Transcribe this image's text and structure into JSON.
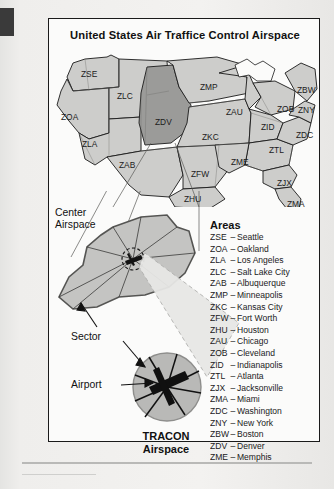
{
  "figure": {
    "title": "United States Air Traffice Control Airspace"
  },
  "map": {
    "regions": [
      {
        "code": "ZSE",
        "x": 32,
        "y": 22,
        "shade": "light"
      },
      {
        "code": "ZLC",
        "x": 68,
        "y": 44,
        "shade": "light"
      },
      {
        "code": "ZOA",
        "x": 12,
        "y": 65,
        "shade": "light"
      },
      {
        "code": "ZLA",
        "x": 33,
        "y": 92,
        "shade": "light"
      },
      {
        "code": "ZAB",
        "x": 70,
        "y": 113,
        "shade": "light"
      },
      {
        "code": "ZDV",
        "x": 106,
        "y": 70,
        "shade": "dark"
      },
      {
        "code": "ZMP",
        "x": 151,
        "y": 35,
        "shade": "light"
      },
      {
        "code": "ZKC",
        "x": 153,
        "y": 85,
        "shade": "light"
      },
      {
        "code": "ZFW",
        "x": 142,
        "y": 122,
        "shade": "light"
      },
      {
        "code": "ZHU",
        "x": 135,
        "y": 147,
        "shade": "light"
      },
      {
        "code": "ZAU",
        "x": 177,
        "y": 60,
        "shade": "light"
      },
      {
        "code": "ZME",
        "x": 182,
        "y": 110,
        "shade": "light"
      },
      {
        "code": "ZID",
        "x": 212,
        "y": 75,
        "shade": "light"
      },
      {
        "code": "ZOB",
        "x": 228,
        "y": 57,
        "shade": "light"
      },
      {
        "code": "ZTL",
        "x": 220,
        "y": 98,
        "shade": "light"
      },
      {
        "code": "ZJX",
        "x": 228,
        "y": 131,
        "shade": "light"
      },
      {
        "code": "ZMA",
        "x": 238,
        "y": 152,
        "shade": "light"
      },
      {
        "code": "ZDC",
        "x": 247,
        "y": 83,
        "shade": "light"
      },
      {
        "code": "ZNY",
        "x": 249,
        "y": 58,
        "shade": "light"
      },
      {
        "code": "ZBW",
        "x": 248,
        "y": 38,
        "shade": "light"
      }
    ]
  },
  "callouts": {
    "center_airspace_line1": "Center",
    "center_airspace_line2": "Airspace",
    "sector": "Sector",
    "airport": "Airport",
    "tracon_line1": "TRACON",
    "tracon_line2": "Airspace"
  },
  "legend": {
    "title": "Areas",
    "entries": [
      {
        "code": "ZSE",
        "name": "Seattle"
      },
      {
        "code": "ZOA",
        "name": "Oakland"
      },
      {
        "code": "ZLA",
        "name": "Los Angeles"
      },
      {
        "code": "ZLC",
        "name": "Salt Lake City"
      },
      {
        "code": "ZAB",
        "name": "Albuquerque"
      },
      {
        "code": "ZMP",
        "name": "Minneapolis"
      },
      {
        "code": "ZKC",
        "name": "Kansas City"
      },
      {
        "code": "ZFW",
        "name": "Fort Worth"
      },
      {
        "code": "ZHU",
        "name": "Houston"
      },
      {
        "code": "ZAU",
        "name": "Chicago"
      },
      {
        "code": "ZOB",
        "name": "Cleveland"
      },
      {
        "code": "ZID",
        "name": "Indianapolis"
      },
      {
        "code": "ZTL",
        "name": "Atlanta"
      },
      {
        "code": "ZJX",
        "name": "Jacksonville"
      },
      {
        "code": "ZMA",
        "name": "Miami"
      },
      {
        "code": "ZDC",
        "name": "Washington"
      },
      {
        "code": "ZNY",
        "name": "New York"
      },
      {
        "code": "ZBW",
        "name": "Boston"
      },
      {
        "code": "ZDV",
        "name": "Denver"
      },
      {
        "code": "ZME",
        "name": "Memphis"
      }
    ],
    "separator": "–"
  },
  "colors": {
    "region_light": "#cdcdcb",
    "region_dark": "#9b9b99",
    "inset_fill": "#c4c4c2",
    "outline": "#1a1a1a",
    "page_background": "#ececeb",
    "figure_background": "#fbfbfa"
  }
}
